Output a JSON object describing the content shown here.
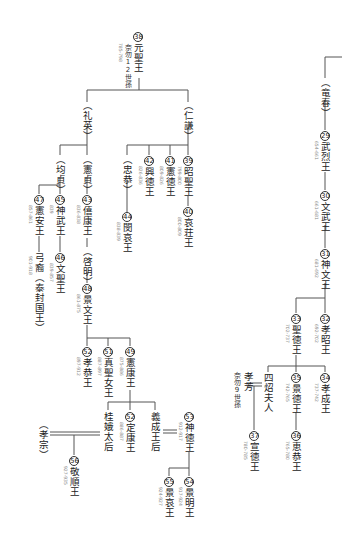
{
  "nodes": [
    {
      "id": "n38",
      "num": "38",
      "name": "元聖王",
      "years": "785-798",
      "note": "奈勿12世孫"
    },
    {
      "id": "p_liying",
      "name": "（礼英）"
    },
    {
      "id": "p_renqian",
      "name": "（仁謙）"
    },
    {
      "id": "n39",
      "num": "39",
      "name": "昭聖王",
      "years": "799-800"
    },
    {
      "id": "n40",
      "num": "40",
      "name": "哀荘王",
      "years": "800-809"
    },
    {
      "id": "n41",
      "num": "41",
      "name": "憲徳王",
      "years": "809-826"
    },
    {
      "id": "n42",
      "num": "42",
      "name": "興徳王",
      "years": "826-836"
    },
    {
      "id": "p_zhonggong",
      "name": "（忠恭）"
    },
    {
      "id": "n44",
      "num": "44",
      "name": "閔哀王",
      "years": "838-839"
    },
    {
      "id": "p_xianzhen",
      "name": "（憲貞）"
    },
    {
      "id": "n43",
      "num": "43",
      "name": "僖康王",
      "years": "836-838"
    },
    {
      "id": "p_qiming",
      "name": "（啓明）"
    },
    {
      "id": "n48",
      "num": "48",
      "name": "景文王",
      "years": "861-875"
    },
    {
      "id": "p_junzhen",
      "name": "（均貞）"
    },
    {
      "id": "n45",
      "num": "45",
      "name": "神武王",
      "years": "839"
    },
    {
      "id": "n46",
      "num": "46",
      "name": "文聖王",
      "years": "839-857"
    },
    {
      "id": "n47",
      "num": "47",
      "name": "憲安王",
      "years": "857-861"
    },
    {
      "id": "gungye",
      "name": "弓裔（泰封国王）",
      "years": "901-918"
    },
    {
      "id": "n49",
      "num": "49",
      "name": "憲康王",
      "years": "875-886"
    },
    {
      "id": "n50",
      "num": "50",
      "name": "定康王",
      "years": "886-887"
    },
    {
      "id": "n51",
      "num": "51",
      "name": "真聖女王",
      "years": "887-897"
    },
    {
      "id": "n52",
      "num": "52",
      "name": "孝恭王",
      "years": "897-912"
    },
    {
      "id": "guie",
      "name": "桂娥太后"
    },
    {
      "id": "yicheng",
      "name": "義成王后"
    },
    {
      "id": "p_xiaozong",
      "name": "（孝宗）"
    },
    {
      "id": "n56",
      "num": "56",
      "name": "敬順王",
      "years": "927-935"
    },
    {
      "id": "n53",
      "num": "53",
      "name": "神徳王",
      "years": "912-917"
    },
    {
      "id": "n54",
      "num": "54",
      "name": "景明王",
      "years": "917-924"
    },
    {
      "id": "n55",
      "num": "55",
      "name": "景哀王",
      "years": "924-927"
    },
    {
      "id": "p_longchun",
      "name": "（竜春）"
    },
    {
      "id": "n29",
      "num": "29",
      "name": "武烈王",
      "years": "654-661"
    },
    {
      "id": "n30",
      "num": "30",
      "name": "文武王",
      "years": "661-681"
    },
    {
      "id": "n31",
      "num": "31",
      "name": "神文王",
      "years": "681-692"
    },
    {
      "id": "n32",
      "num": "32",
      "name": "孝昭王",
      "years": "692-702"
    },
    {
      "id": "n33",
      "num": "33",
      "name": "聖徳王",
      "years": "702-737"
    },
    {
      "id": "n34",
      "num": "34",
      "name": "孝成王",
      "years": "737-742"
    },
    {
      "id": "n35",
      "num": "35",
      "name": "景徳王",
      "years": "742-765"
    },
    {
      "id": "n36",
      "num": "36",
      "name": "恵恭王",
      "years": "765-780"
    },
    {
      "id": "sishao",
      "name": "四炤夫人"
    },
    {
      "id": "xiaofang",
      "name": "孝芳",
      "note": "奈勿9世孫"
    },
    {
      "id": "n37",
      "num": "37",
      "name": "宣徳王",
      "years": "780-785"
    }
  ]
}
